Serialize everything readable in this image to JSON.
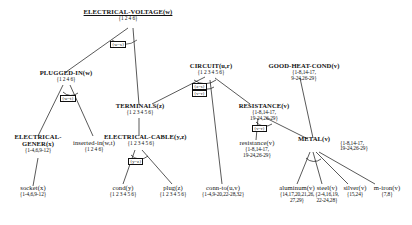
{
  "diagram": {
    "nodes": [
      {
        "id": "electrical-voltage",
        "label": "ELECTRICAL-VOLTAGE(w)",
        "set": "{1 2 4 6}",
        "set2": ""
      },
      {
        "id": "plugged-in",
        "label": "PLUGGED-IN(w)",
        "set": "{1 2 4 6}",
        "set2": ""
      },
      {
        "id": "circuit",
        "label": "CIRCUIT(u,r)",
        "set": "{1 2 3 4 5 6}",
        "set2": ""
      },
      {
        "id": "good-heat-cond",
        "label": "GOOD-HEAT-COND(v)",
        "set": "{1-8,14-17,",
        "set2": "9-24,26-29}"
      },
      {
        "id": "terminals",
        "label": "TERMINALS(z)",
        "set": "{1 2 3 4 5 6}",
        "set2": ""
      },
      {
        "id": "resistance-up",
        "label": "RESISTANCE(v)",
        "set": "{1-8,14-17,",
        "set2": "19-24,26-29}"
      },
      {
        "id": "electrical-gener",
        "label": "ELECTRICAL-",
        "label2": "GENER(x)",
        "set": "{1-4,6,9-12}",
        "set2": ""
      },
      {
        "id": "inserted-in",
        "label": "inserted-in(w,t)",
        "set": "{1 2 4 6}",
        "set2": ""
      },
      {
        "id": "electrical-cable",
        "label": "ELECTRICAL-CABLE(y,z)",
        "set": "{1 2 3 4 5 6}",
        "set2": ""
      },
      {
        "id": "resistance-low",
        "label": "resistance(v)",
        "set": "{1-8,14-17,",
        "set2": "19-24,26-29}"
      },
      {
        "id": "metal",
        "label": "METAL(v)",
        "set": "{1-8,14-17,",
        "set2": "19-24,26-29}"
      },
      {
        "id": "socket",
        "label": "socket(x)",
        "set": "{1-4,6,9-12}",
        "set2": ""
      },
      {
        "id": "cond",
        "label": "cond(y)",
        "set": "{1 2 3 4 5 6}",
        "set2": ""
      },
      {
        "id": "plug",
        "label": "plug(z)",
        "set": "{1 2 3 4 5 6}",
        "set2": ""
      },
      {
        "id": "conn-to",
        "label": "conn-to(u,v)",
        "set": "{1-4,9-20,22-28,32}",
        "set2": ""
      },
      {
        "id": "aluminum",
        "label": "aluminum(v)",
        "set": "{14,17,20,21,26,",
        "set2": "27,29}"
      },
      {
        "id": "steel",
        "label": "steel(v)",
        "set": "{2-4,16,19,",
        "set2": "22-24,28}"
      },
      {
        "id": "silver",
        "label": "silver(v)",
        "set": "{15,24}",
        "set2": ""
      },
      {
        "id": "m-iron",
        "label": "m-iron(v)",
        "set": "{7,8}",
        "set2": ""
      }
    ],
    "unifications": [
      {
        "id": "u-root",
        "text": "{w=s}"
      },
      {
        "id": "u-plugged",
        "text": "{w=t}"
      },
      {
        "id": "u-circuit-1",
        "text": "{z=s}"
      },
      {
        "id": "u-circuit-2",
        "text": "{v=r}"
      },
      {
        "id": "u-resist",
        "text": "{v=r}"
      },
      {
        "id": "u-cable",
        "text": "{y=z}"
      }
    ]
  }
}
